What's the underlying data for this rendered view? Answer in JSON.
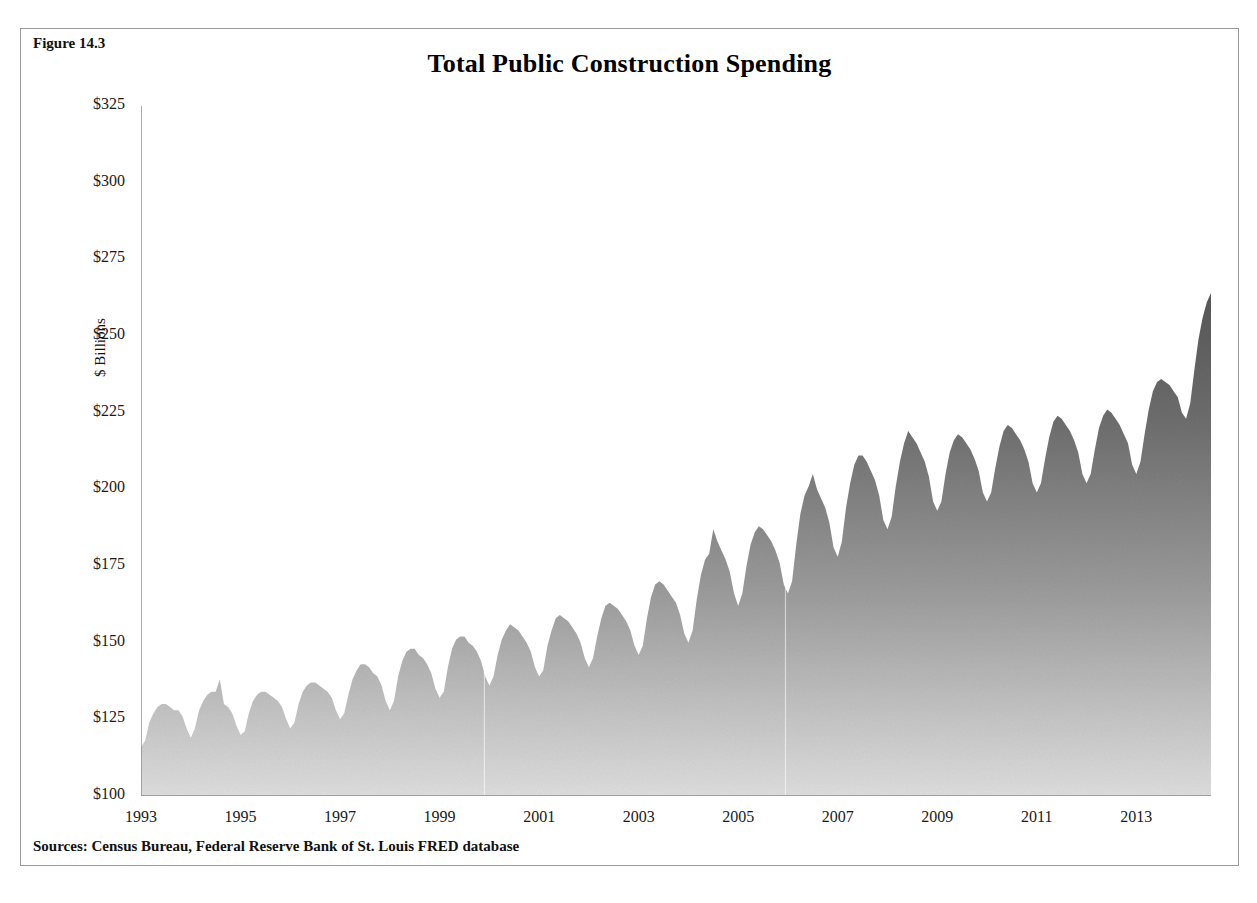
{
  "figure": {
    "label": "Figure 14.3",
    "title": "Total Public Construction Spending",
    "source": "Sources: Census Bureau, Federal Reserve Bank of St. Louis FRED database"
  },
  "axes": {
    "y_title": "$ Billions",
    "y_ticks": [
      "$100",
      "$125",
      "$150",
      "$175",
      "$200",
      "$225",
      "$250",
      "$275",
      "$300",
      "$325"
    ],
    "x_ticks": [
      "1993",
      "1995",
      "1997",
      "1999",
      "2001",
      "2003",
      "2005",
      "2007",
      "2009",
      "2011",
      "2013"
    ]
  },
  "style": {
    "area_top_color": "#4a4a4a",
    "area_bottom_color": "#d8d8d8",
    "axis_color": "#8c8c8c",
    "border_color": "#9a9a9a",
    "text_color": "#111111"
  },
  "chart_data": {
    "type": "area",
    "title": "Total Public Construction Spending",
    "xlabel": "",
    "ylabel": "$ Billions",
    "ylim": [
      100,
      325
    ],
    "xlim": [
      1993.0,
      2014.5
    ],
    "grid": false,
    "legend": null,
    "x_tick_values": [
      1993,
      1995,
      1997,
      1999,
      2001,
      2003,
      2005,
      2007,
      2009,
      2011,
      2013
    ],
    "y_tick_values": [
      100,
      125,
      150,
      175,
      200,
      225,
      250,
      275,
      300,
      325
    ],
    "annotations": [
      {
        "text": "faint vertical rule",
        "x": 1999.9
      },
      {
        "text": "faint vertical rule",
        "x": 2005.95
      }
    ],
    "series": [
      {
        "name": "Total public construction spending",
        "units": "billions of dollars, seasonally unadjusted monthly",
        "x_start": 1993.0,
        "x_step": 0.08333,
        "values": [
          116,
          118,
          124,
          127,
          129,
          130,
          130,
          129,
          128,
          128,
          126,
          122,
          119,
          122,
          128,
          131,
          133,
          134,
          134,
          138,
          130,
          129,
          127,
          123,
          120,
          121,
          127,
          131,
          133,
          134,
          134,
          133,
          132,
          131,
          129,
          125,
          122,
          124,
          130,
          134,
          136,
          137,
          137,
          136,
          135,
          134,
          132,
          128,
          125,
          127,
          133,
          138,
          141,
          143,
          143,
          142,
          140,
          139,
          136,
          131,
          128,
          131,
          139,
          144,
          147,
          148,
          148,
          146,
          145,
          143,
          140,
          135,
          132,
          134,
          142,
          148,
          151,
          152,
          152,
          150,
          149,
          147,
          144,
          139,
          136,
          139,
          146,
          151,
          154,
          156,
          155,
          154,
          152,
          150,
          147,
          142,
          139,
          141,
          149,
          154,
          158,
          159,
          158,
          157,
          155,
          153,
          150,
          145,
          142,
          145,
          152,
          158,
          162,
          163,
          162,
          161,
          159,
          157,
          154,
          149,
          146,
          149,
          158,
          165,
          169,
          170,
          169,
          167,
          165,
          163,
          159,
          153,
          150,
          154,
          164,
          172,
          177,
          179,
          187,
          183,
          180,
          177,
          173,
          166,
          162,
          166,
          175,
          182,
          186,
          188,
          187,
          185,
          183,
          180,
          176,
          169,
          166,
          170,
          182,
          192,
          198,
          201,
          205,
          200,
          197,
          194,
          189,
          181,
          178,
          183,
          194,
          202,
          208,
          211,
          211,
          209,
          206,
          203,
          198,
          190,
          187,
          191,
          201,
          209,
          215,
          219,
          217,
          215,
          212,
          209,
          204,
          196,
          193,
          196,
          205,
          212,
          216,
          218,
          217,
          215,
          213,
          210,
          206,
          199,
          196,
          199,
          207,
          214,
          219,
          221,
          220,
          218,
          216,
          213,
          209,
          202,
          199,
          202,
          210,
          217,
          222,
          224,
          223,
          221,
          219,
          216,
          212,
          205,
          202,
          205,
          213,
          220,
          224,
          226,
          225,
          223,
          221,
          218,
          215,
          208,
          205,
          209,
          218,
          226,
          232,
          235,
          236,
          235,
          234,
          232,
          230,
          225,
          223,
          228,
          239,
          249,
          256,
          261,
          264,
          265,
          266,
          266,
          264,
          258,
          256,
          262,
          274,
          285,
          293,
          298,
          300,
          299,
          297,
          296,
          293,
          287,
          285,
          290,
          299,
          307,
          312,
          315,
          314,
          312,
          310,
          309,
          308,
          303,
          301,
          306,
          314,
          320,
          324,
          323,
          321,
          318,
          315,
          313,
          310,
          304,
          302,
          305,
          311,
          314,
          313,
          310,
          307,
          304,
          300,
          297,
          293,
          287,
          285,
          290,
          300,
          308,
          313,
          311,
          306,
          300,
          294,
          289,
          284,
          277,
          274,
          277,
          284,
          289,
          291,
          290,
          288,
          286,
          283,
          280,
          276,
          270,
          267,
          269,
          275,
          280,
          282,
          281,
          279,
          277,
          274,
          271,
          268,
          262,
          260,
          262,
          268,
          272,
          274,
          273,
          271,
          269,
          266,
          264,
          261,
          256,
          254,
          256,
          262,
          266,
          269,
          268,
          266,
          264,
          262,
          260,
          257,
          253,
          252,
          255,
          262,
          268,
          272,
          273,
          272,
          270,
          268,
          266,
          263,
          259,
          258,
          261,
          267,
          271,
          273,
          272,
          270,
          268,
          266,
          264,
          261
        ]
      }
    ]
  }
}
